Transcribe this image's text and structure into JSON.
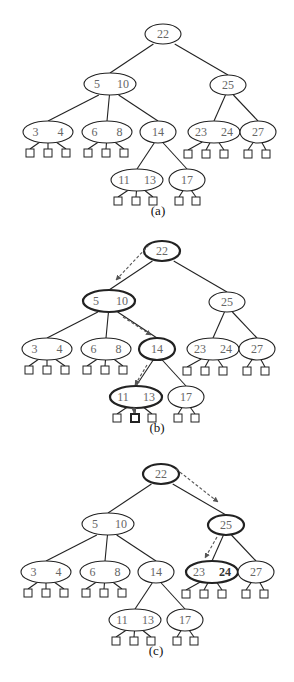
{
  "figure": {
    "colors": {
      "stroke": "#222222",
      "key_text": "#666666",
      "arrow": "#555555"
    }
  },
  "tree_layout": {
    "nodes": [
      {
        "id": "r",
        "keys": [
          "22"
        ],
        "cx": 163,
        "cy": 34,
        "rx": 18,
        "ry": 10
      },
      {
        "id": "a",
        "keys": [
          "5",
          "10"
        ],
        "cx": 110,
        "cy": 84,
        "rx": 26,
        "ry": 11
      },
      {
        "id": "b",
        "keys": [
          "25"
        ],
        "cx": 228,
        "cy": 85,
        "rx": 18,
        "ry": 10
      },
      {
        "id": "c",
        "keys": [
          "3",
          "4"
        ],
        "cx": 48,
        "cy": 132,
        "rx": 25,
        "ry": 11
      },
      {
        "id": "d",
        "keys": [
          "6",
          "8"
        ],
        "cx": 107,
        "cy": 132,
        "rx": 25,
        "ry": 11
      },
      {
        "id": "e",
        "keys": [
          "14"
        ],
        "cx": 158,
        "cy": 132,
        "rx": 18,
        "ry": 11
      },
      {
        "id": "f",
        "keys": [
          "23",
          "24"
        ],
        "cx": 214,
        "cy": 132,
        "rx": 26,
        "ry": 11
      },
      {
        "id": "g",
        "keys": [
          "27"
        ],
        "cx": 258,
        "cy": 132,
        "rx": 18,
        "ry": 11
      },
      {
        "id": "h",
        "keys": [
          "11",
          "13"
        ],
        "cx": 137,
        "cy": 180,
        "rx": 26,
        "ry": 11
      },
      {
        "id": "i",
        "keys": [
          "17"
        ],
        "cx": 187,
        "cy": 180,
        "rx": 18,
        "ry": 11
      }
    ],
    "edges": [
      [
        "r",
        "a"
      ],
      [
        "r",
        "b"
      ],
      [
        "a",
        "c"
      ],
      [
        "a",
        "d"
      ],
      [
        "a",
        "e"
      ],
      [
        "b",
        "f"
      ],
      [
        "b",
        "g"
      ],
      [
        "e",
        "h"
      ],
      [
        "e",
        "i"
      ]
    ],
    "leaves": [
      {
        "parent": "c",
        "xs": [
          30,
          48,
          66
        ],
        "y": 153
      },
      {
        "parent": "d",
        "xs": [
          88,
          106,
          124
        ],
        "y": 153
      },
      {
        "parent": "f",
        "xs": [
          188,
          206,
          224
        ],
        "y": 154
      },
      {
        "parent": "g",
        "xs": [
          248,
          266
        ],
        "y": 154
      },
      {
        "parent": "h",
        "xs": [
          118,
          136,
          153
        ],
        "y": 201
      },
      {
        "parent": "i",
        "xs": [
          179,
          196
        ],
        "y": 201
      }
    ],
    "caption_y": 211
  },
  "panels": [
    {
      "label": "(a)",
      "dx": 0,
      "dy": 0,
      "highlight_nodes": [],
      "highlight_leaf": null,
      "bold_keys": [],
      "arrows": []
    },
    {
      "label": "(b)",
      "dx": -1,
      "dy": 217,
      "highlight_nodes": [
        "r",
        "a",
        "e",
        "h"
      ],
      "highlight_leaf": {
        "parent": "h",
        "index": 1
      },
      "bold_keys": [],
      "arrows": [
        {
          "from": [
            150,
            28
          ],
          "to": [
            117,
            63
          ]
        },
        {
          "from": [
            124,
            100
          ],
          "to": [
            152,
            118
          ]
        },
        {
          "from": [
            148,
            148
          ],
          "to": [
            136,
            168
          ]
        },
        {
          "from": [
            135,
            190
          ],
          "to": [
            135,
            196
          ]
        }
      ]
    },
    {
      "label": "(c)",
      "dx": -2,
      "dy": 440,
      "highlight_nodes": [
        "r",
        "b",
        "f"
      ],
      "highlight_leaf": null,
      "bold_keys": [
        {
          "node": "f",
          "index": 1
        }
      ],
      "arrows": [
        {
          "from": [
            178,
            29
          ],
          "to": [
            220,
            62
          ]
        },
        {
          "from": [
            219,
            97
          ],
          "to": [
            207,
            118
          ]
        }
      ]
    }
  ]
}
